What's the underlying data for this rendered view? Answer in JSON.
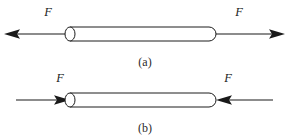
{
  "figure": {
    "background_color": "#ffffff",
    "line_color": "#1c1c1c",
    "width": 290,
    "height": 139,
    "panels": [
      {
        "id": "a",
        "caption": "(a)",
        "loading": "tension",
        "caption_x": 145,
        "caption_y": 66,
        "rod": {
          "left": 70,
          "right": 216,
          "top": 27,
          "bottom": 41,
          "cap_rx": 5,
          "cap_ry": 7
        },
        "forces": [
          {
            "label": "F",
            "label_x": 48,
            "label_y": 16,
            "direction": "left",
            "shaft_from_x": 70,
            "shaft_to_x": 12,
            "shaft_y": 34,
            "tip_x": 5
          },
          {
            "label": "F",
            "label_x": 239,
            "label_y": 16,
            "direction": "right",
            "shaft_from_x": 216,
            "shaft_to_x": 276,
            "shaft_y": 34,
            "tip_x": 284
          }
        ]
      },
      {
        "id": "b",
        "caption": "(b)",
        "loading": "compression",
        "caption_x": 145,
        "caption_y": 132,
        "rod": {
          "left": 70,
          "right": 216,
          "top": 93,
          "bottom": 107,
          "cap_rx": 5,
          "cap_ry": 7
        },
        "forces": [
          {
            "label": "F",
            "label_x": 60,
            "label_y": 82,
            "direction": "right",
            "shaft_from_x": 16,
            "shaft_to_x": 62,
            "shaft_y": 100,
            "tip_x": 69
          },
          {
            "label": "F",
            "label_x": 228,
            "label_y": 82,
            "direction": "left",
            "shaft_from_x": 272,
            "shaft_to_x": 224,
            "shaft_y": 100,
            "tip_x": 217
          }
        ]
      }
    ]
  }
}
